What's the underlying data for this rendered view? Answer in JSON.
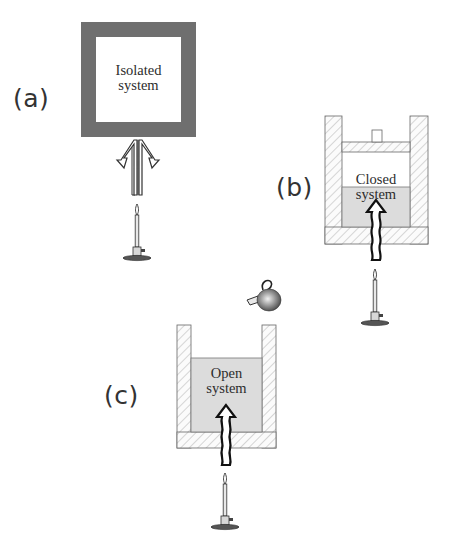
{
  "figure": {
    "panels": [
      {
        "id": "a",
        "label": "(a)",
        "system_label_line1": "Isolated",
        "system_label_line2": "system",
        "boundary": "thick insulated wall",
        "energy_exchange": "heat blocked (arrows deflected)",
        "matter_exchange": "none"
      },
      {
        "id": "b",
        "label": "(b)",
        "system_label_line1": "Closed",
        "system_label_line2": "system",
        "boundary": "cylinder with piston",
        "energy_exchange": "heat enters",
        "matter_exchange": "none"
      },
      {
        "id": "c",
        "label": "(c)",
        "system_label_line1": "Open",
        "system_label_line2": "system",
        "boundary": "open container",
        "energy_exchange": "heat enters",
        "matter_exchange": "matter added from teapot"
      }
    ],
    "icons": [
      "bunsen-burner-icon",
      "heat-arrow-icon",
      "teapot-icon",
      "deflected-arrows-icon"
    ],
    "colors": {
      "isolated_wall": "#6f6f6f",
      "system_fill": "#dcdcdc",
      "hatch": "#8a8a8a",
      "outline": "#555555",
      "text": "#2c2c2c"
    },
    "caption_partial": ""
  }
}
